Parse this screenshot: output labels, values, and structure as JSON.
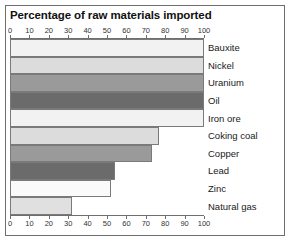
{
  "chart_data": {
    "type": "bar",
    "orientation": "horizontal",
    "title": "Percentage of raw materials imported",
    "xlabel": "",
    "ylabel": "",
    "xlim": [
      0,
      100
    ],
    "grid": false,
    "legend": "none",
    "tick_labels": [
      "0",
      "10",
      "20",
      "30",
      "40",
      "50",
      "60",
      "70",
      "80",
      "90",
      "100"
    ],
    "tick_values": [
      0,
      10,
      20,
      30,
      40,
      50,
      60,
      70,
      80,
      90,
      100
    ],
    "axis_positions": [
      "top",
      "bottom"
    ],
    "categories": [
      "Bauxite",
      "Nickel",
      "Uranium",
      "Oil",
      "Iron ore",
      "Coking coal",
      "Copper",
      "Lead",
      "Zinc",
      "Natural gas"
    ],
    "values": [
      100,
      100,
      100,
      100,
      100,
      77,
      73,
      54,
      52,
      32
    ],
    "bar_colors": [
      "#f2f2f2",
      "#dcdcdc",
      "#9a9a9a",
      "#6b6b6b",
      "#f2f2f2",
      "#dcdcdc",
      "#9a9a9a",
      "#6b6b6b",
      "#fafafa",
      "#e0e0e0"
    ]
  },
  "frame": {
    "border_color": "#6e6e6e"
  }
}
